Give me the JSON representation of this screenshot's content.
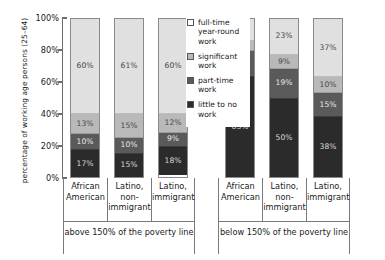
{
  "chart_data": {
    "type": "bar",
    "subtype": "stacked-100-percent",
    "title": "",
    "xlabel": "",
    "ylabel": "percentage of working age persons (25–64)",
    "ylim": [
      0,
      100
    ],
    "ytick_labels": [
      "0%",
      "20%",
      "40%",
      "60%",
      "80%",
      "100%"
    ],
    "ytick_values": [
      0,
      20,
      40,
      60,
      80,
      100
    ],
    "grid": false,
    "legend_position": "inside-right",
    "categories": [
      "African American",
      "Latino, non-immigrant",
      "Latino, immigrant",
      "African American",
      "Latino, non-immigrant",
      "Latino, immigrant"
    ],
    "groups": [
      {
        "label": "above 150% of the poverty line",
        "categories": [
          0,
          1,
          2
        ]
      },
      {
        "label": "below 150% of the poverty line",
        "categories": [
          3,
          4,
          5
        ]
      }
    ],
    "series": [
      {
        "name": "full-time year-round work",
        "color": "#e0e0e0",
        "values": [
          60,
          61,
          60,
          14,
          23,
          37
        ]
      },
      {
        "name": "significant work",
        "color": "#b9b9b9",
        "values": [
          13,
          15,
          12,
          6,
          9,
          10
        ]
      },
      {
        "name": "part-time work",
        "color": "#5a5a5a",
        "values": [
          10,
          10,
          9,
          17,
          19,
          15
        ]
      },
      {
        "name": "little to no work",
        "color": "#2b2b2b",
        "values": [
          17,
          15,
          18,
          63,
          50,
          38
        ]
      }
    ]
  },
  "axis": {
    "y_title": "percentage of working age persons (25–64)",
    "ticks": [
      {
        "label": "100%",
        "value": 100
      },
      {
        "label": "80%",
        "value": 80
      },
      {
        "label": "60%",
        "value": 60
      },
      {
        "label": "40%",
        "value": 40
      },
      {
        "label": "20%",
        "value": 20
      },
      {
        "label": "0%",
        "value": 0
      }
    ]
  },
  "legend": {
    "items": [
      {
        "label": "full-time year-round work",
        "swatch": "sw-full"
      },
      {
        "label": "significant work",
        "swatch": "sw-sig"
      },
      {
        "label": "part-time work",
        "swatch": "sw-part"
      },
      {
        "label": "little to no work",
        "swatch": "sw-none"
      }
    ]
  },
  "bars": [
    {
      "category": "African American",
      "segments": [
        {
          "label": "60%",
          "value": 60,
          "cls": "s-full"
        },
        {
          "label": "13%",
          "value": 13,
          "cls": "s-sig"
        },
        {
          "label": "10%",
          "value": 10,
          "cls": "s-part"
        },
        {
          "label": "17%",
          "value": 17,
          "cls": "s-none"
        }
      ]
    },
    {
      "category": "Latino, non-immigrant",
      "segments": [
        {
          "label": "61%",
          "value": 61,
          "cls": "s-full"
        },
        {
          "label": "15%",
          "value": 15,
          "cls": "s-sig"
        },
        {
          "label": "10%",
          "value": 10,
          "cls": "s-part"
        },
        {
          "label": "15%",
          "value": 15,
          "cls": "s-none"
        }
      ]
    },
    {
      "category": "Latino, immigrant",
      "segments": [
        {
          "label": "60%",
          "value": 60,
          "cls": "s-full"
        },
        {
          "label": "12%",
          "value": 12,
          "cls": "s-sig"
        },
        {
          "label": "9%",
          "value": 9,
          "cls": "s-part"
        },
        {
          "label": "18%",
          "value": 18,
          "cls": "s-none"
        }
      ]
    },
    {
      "category": "African American",
      "segments": [
        {
          "label": "14%",
          "value": 14,
          "cls": "s-full"
        },
        {
          "label": "6%",
          "value": 6,
          "cls": "s-sig"
        },
        {
          "label": "17%",
          "value": 17,
          "cls": "s-part"
        },
        {
          "label": "63%",
          "value": 63,
          "cls": "s-none"
        }
      ]
    },
    {
      "category": "Latino, non-immigrant",
      "segments": [
        {
          "label": "23%",
          "value": 23,
          "cls": "s-full"
        },
        {
          "label": "9%",
          "value": 9,
          "cls": "s-sig"
        },
        {
          "label": "19%",
          "value": 19,
          "cls": "s-part"
        },
        {
          "label": "50%",
          "value": 50,
          "cls": "s-none"
        }
      ]
    },
    {
      "category": "Latino, immigrant",
      "segments": [
        {
          "label": "37%",
          "value": 37,
          "cls": "s-full"
        },
        {
          "label": "10%",
          "value": 10,
          "cls": "s-sig"
        },
        {
          "label": "15%",
          "value": 15,
          "cls": "s-part"
        },
        {
          "label": "38%",
          "value": 38,
          "cls": "s-none"
        }
      ]
    }
  ],
  "category_labels": [
    "African American",
    "Latino, non-immigrant",
    "Latino, immigrant",
    "African American",
    "Latino, non-immigrant",
    "Latino, immigrant"
  ],
  "group_labels": [
    "above 150% of the poverty line",
    "below 150% of the poverty line"
  ]
}
